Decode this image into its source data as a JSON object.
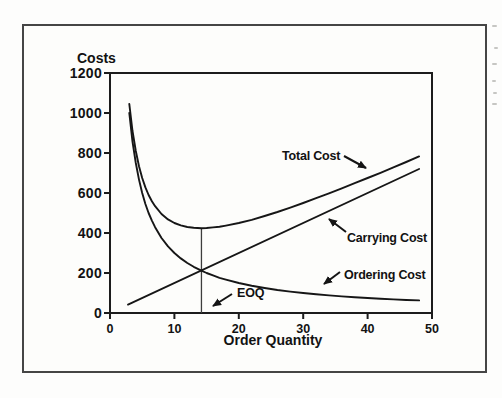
{
  "chart_data": {
    "type": "line",
    "title": "",
    "xlabel": "Order Quantity",
    "ylabel": "Costs",
    "xlim": [
      0,
      50
    ],
    "ylim": [
      0,
      1200
    ],
    "xticks": [
      0,
      10,
      20,
      30,
      40,
      50
    ],
    "yticks": [
      0,
      200,
      400,
      600,
      800,
      1000,
      1200
    ],
    "grid": false,
    "legend_position": "none",
    "series": [
      {
        "name": "Total Cost",
        "x": [
          3,
          3.5,
          4,
          4.5,
          5,
          5.5,
          6,
          6.5,
          7,
          8,
          9,
          10,
          11,
          12,
          13,
          14.2,
          15,
          16,
          17,
          18,
          20,
          22,
          24,
          26,
          28,
          30,
          32,
          34,
          36,
          38,
          40,
          42,
          44,
          46,
          48
        ],
        "y": [
          1045,
          910,
          810,
          734,
          675,
          628,
          590,
          559,
          534,
          495,
          468,
          450,
          438,
          430,
          426,
          424,
          425,
          428,
          431,
          437,
          450,
          466,
          485,
          505,
          527,
          550,
          574,
          598,
          623,
          649,
          675,
          701,
          728,
          755,
          783
        ]
      },
      {
        "name": "Carrying Cost",
        "x": [
          2.8,
          48
        ],
        "y": [
          42,
          720
        ]
      },
      {
        "name": "Ordering Cost",
        "x": [
          3,
          3.5,
          4,
          4.5,
          5,
          5.5,
          6,
          6.5,
          7,
          8,
          9,
          10,
          11,
          12,
          13,
          14.2,
          15,
          16,
          17,
          18,
          20,
          22,
          24,
          26,
          28,
          30,
          32,
          34,
          36,
          38,
          40,
          42,
          44,
          46,
          48
        ],
        "y": [
          1000,
          857,
          750,
          667,
          600,
          545,
          500,
          462,
          429,
          375,
          333,
          300,
          273,
          250,
          231,
          212,
          200,
          188,
          176,
          167,
          150,
          136,
          125,
          115,
          107,
          100,
          94,
          88,
          83,
          79,
          75,
          71,
          68,
          65,
          63
        ]
      }
    ],
    "annotations": {
      "total_label": "Total Cost",
      "carrying_label": "Carrying Cost",
      "ordering_label": "Ordering Cost",
      "eoq_label": "EOQ",
      "eoq_x": 14.2,
      "eoq_line_top_y": 424
    },
    "line_color": "#161616",
    "axis_color": "#1c1c1c"
  }
}
